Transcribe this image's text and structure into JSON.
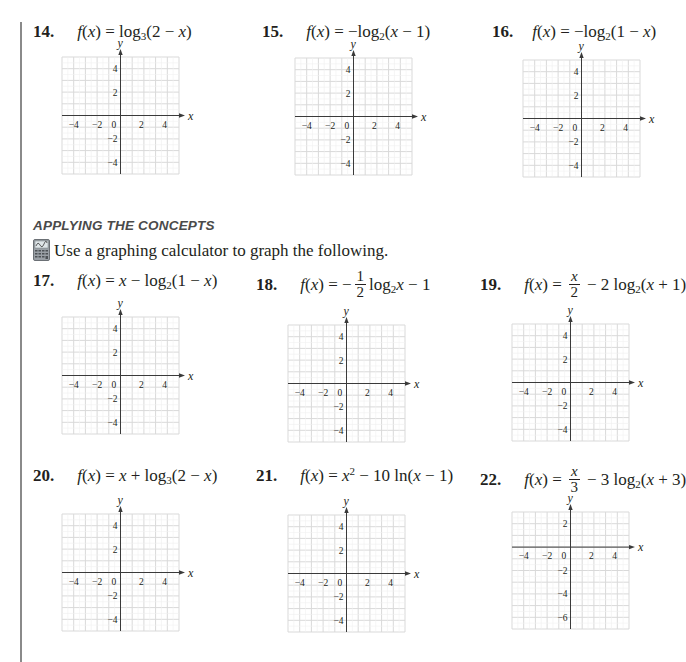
{
  "section": {
    "title": "APPLYING THE CONCEPTS",
    "instruction": "Use a graphing calculator to graph the following.",
    "instruction_icon": "graphing-calculator-icon"
  },
  "axis_labels": {
    "x": "x",
    "y": "y"
  },
  "problems": [
    {
      "number": "14.",
      "formula_text": "f(x) = log3(2 − x)",
      "x_ticks": [
        "−4",
        "−2",
        "0",
        "2",
        "4"
      ],
      "y_ticks": [
        "4",
        "2",
        "−2",
        "−4"
      ],
      "x_range": [
        -5,
        5
      ],
      "y_range": [
        -5,
        5
      ]
    },
    {
      "number": "15.",
      "formula_text": "f(x) = −log2(x − 1)",
      "x_ticks": [
        "−4",
        "−2",
        "0",
        "2",
        "4"
      ],
      "y_ticks": [
        "4",
        "2",
        "−2",
        "−4"
      ],
      "x_range": [
        -5,
        5
      ],
      "y_range": [
        -5,
        5
      ]
    },
    {
      "number": "16.",
      "formula_text": "f(x) = −log2(1 − x)",
      "x_ticks": [
        "−4",
        "−2",
        "0",
        "2",
        "4"
      ],
      "y_ticks": [
        "4",
        "2",
        "−2",
        "−4"
      ],
      "x_range": [
        -5,
        5
      ],
      "y_range": [
        -5,
        5
      ]
    },
    {
      "number": "17.",
      "formula_text": "f(x) = x − log2(1 − x)",
      "x_ticks": [
        "−4",
        "−2",
        "0",
        "2",
        "4"
      ],
      "y_ticks": [
        "4",
        "2",
        "−2",
        "−4"
      ],
      "x_range": [
        -5,
        5
      ],
      "y_range": [
        -5,
        5
      ]
    },
    {
      "number": "18.",
      "formula_text": "f(x) = −(1/2)log2x − 1",
      "x_ticks": [
        "−4",
        "−2",
        "0",
        "2",
        "4"
      ],
      "y_ticks": [
        "4",
        "2",
        "−2",
        "−4"
      ],
      "x_range": [
        -5,
        5
      ],
      "y_range": [
        -5,
        5
      ]
    },
    {
      "number": "19.",
      "formula_text": "f(x) = x/2 − 2 log2(x + 1)",
      "x_ticks": [
        "−4",
        "−2",
        "0",
        "2",
        "4"
      ],
      "y_ticks": [
        "4",
        "2",
        "−2",
        "−4"
      ],
      "x_range": [
        -5,
        5
      ],
      "y_range": [
        -5,
        5
      ]
    },
    {
      "number": "20.",
      "formula_text": "f(x) = x + log3(2 − x)",
      "x_ticks": [
        "−4",
        "−2",
        "0",
        "2",
        "4"
      ],
      "y_ticks": [
        "4",
        "2",
        "−2",
        "−4"
      ],
      "x_range": [
        -5,
        5
      ],
      "y_range": [
        -5,
        5
      ]
    },
    {
      "number": "21.",
      "formula_text": "f(x) = x² − 10 ln(x − 1)",
      "x_ticks": [
        "−4",
        "−2",
        "0",
        "2",
        "4"
      ],
      "y_ticks": [
        "4",
        "2",
        "−2",
        "−4"
      ],
      "x_range": [
        -5,
        5
      ],
      "y_range": [
        -5,
        5
      ]
    },
    {
      "number": "22.",
      "formula_text": "f(x) = x/3 − 3 log2(x + 3)",
      "x_ticks": [
        "−4",
        "−2",
        "0",
        "2",
        "4"
      ],
      "y_ticks": [
        "2",
        "−2",
        "−4",
        "−6"
      ],
      "x_range": [
        -5,
        5
      ],
      "y_range": [
        -7,
        3
      ]
    }
  ],
  "formula_parts": {
    "f": "f",
    "x": "x",
    "eq": " = ",
    "minus": " − ",
    "plus": " + ",
    "neg": "−",
    "log": "log",
    "ln": "ln",
    "b2": "2",
    "b3": "3",
    "one": "1",
    "two": "2",
    "three": "3",
    "ten": "10",
    "lp": "(",
    "rp": ")",
    "sq": "2"
  },
  "colors": {
    "text": "#231f20",
    "grid": "#d9d9d9",
    "axis": "#3a3a3a",
    "section_title": "#4a4a4a",
    "margin_bar": "#8a8a8a"
  }
}
